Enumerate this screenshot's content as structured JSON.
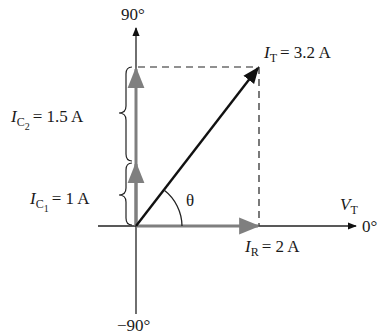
{
  "diagram": {
    "type": "phasor",
    "axes": {
      "top_label": "90°",
      "bottom_label": "−90°",
      "right_label": "0°",
      "reference": {
        "symbol": "V",
        "subscript": "T"
      }
    },
    "phasors": [
      {
        "id": "IR",
        "symbol": "I",
        "subscript": "R",
        "value_text": "= 2 A",
        "magnitude": 2,
        "angle_deg": 0,
        "color": "#7f7f7f"
      },
      {
        "id": "IC1",
        "symbol": "I",
        "subscript": "C",
        "subsub": "1",
        "value_text": "= 1 A",
        "magnitude": 1,
        "angle_deg": 90,
        "color": "#7f7f7f"
      },
      {
        "id": "IC2",
        "symbol": "I",
        "subscript": "C",
        "subsub": "2",
        "value_text": "= 1.5 A",
        "magnitude": 1.5,
        "angle_deg": 90,
        "color": "#7f7f7f"
      },
      {
        "id": "IT",
        "symbol": "I",
        "subscript": "T",
        "value_text": "= 3.2 A",
        "magnitude": 3.2,
        "color": "#111111"
      }
    ],
    "angle_label": "θ",
    "colors": {
      "axis": "#222222",
      "dashed": "#222222",
      "phasor_gray": "#7f7f7f",
      "total": "#111111"
    }
  }
}
